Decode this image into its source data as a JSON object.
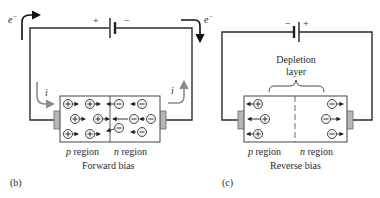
{
  "figure_b": {
    "panel_label": "(b)",
    "caption": "Forward bias",
    "battery": {
      "left_terminal": "+",
      "right_terminal": "−"
    },
    "electron_label_left": "e",
    "electron_label_right": "e",
    "electron_superscript": "−",
    "current_label_left": "i",
    "current_label_right": "i",
    "region_p": "p region",
    "region_n": "n region",
    "p_carriers": [
      "+",
      "+",
      "+",
      "+",
      "+",
      "+"
    ],
    "n_carriers": [
      "−",
      "−",
      "−",
      "−",
      "−",
      "−"
    ]
  },
  "figure_c": {
    "panel_label": "(c)",
    "caption": "Reverse bias",
    "battery": {
      "left_terminal": "−",
      "right_terminal": "+"
    },
    "depletion_label_line1": "Depletion",
    "depletion_label_line2": "layer",
    "region_p": "p region",
    "region_n": "n region",
    "p_carriers": [
      "+",
      "+",
      "+"
    ],
    "n_carriers": [
      "−",
      "−",
      "−"
    ]
  },
  "colors": {
    "wire": "#2b2b2b",
    "current_arrow": "#8a8a8a",
    "contact": "#b7b7b7"
  }
}
